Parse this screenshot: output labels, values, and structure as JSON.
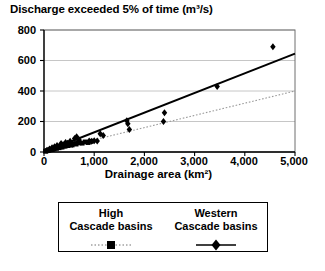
{
  "chart_data": {
    "type": "scatter",
    "title": "Discharge exceeded 5% of time (m³/s)",
    "xlabel": "Drainage area (km²)",
    "ylabel": "",
    "xlim": [
      0,
      5000
    ],
    "ylim": [
      0,
      800
    ],
    "xticks": [
      0,
      1000,
      2000,
      3000,
      4000,
      5000
    ],
    "xticklabels": [
      "0",
      "1,000",
      "2,000",
      "3,000",
      "4,000",
      "5,000"
    ],
    "yticks": [
      0,
      200,
      400,
      600,
      800
    ],
    "yticklabels": [
      "0",
      "200",
      "400",
      "600",
      "800"
    ],
    "grid": "horizontal",
    "legend_position": "below-axes",
    "series": [
      {
        "name": "High Cascade basins",
        "marker": "square",
        "line": "dotted",
        "color": "#000000",
        "trendline": {
          "x": [
            0,
            5000
          ],
          "y": [
            0,
            400
          ]
        },
        "points": [
          {
            "x": 30,
            "y": 5
          },
          {
            "x": 55,
            "y": 8
          },
          {
            "x": 75,
            "y": 10
          },
          {
            "x": 95,
            "y": 12
          },
          {
            "x": 120,
            "y": 14
          },
          {
            "x": 140,
            "y": 18
          },
          {
            "x": 165,
            "y": 16
          },
          {
            "x": 185,
            "y": 22
          },
          {
            "x": 200,
            "y": 20
          },
          {
            "x": 225,
            "y": 26
          },
          {
            "x": 250,
            "y": 24
          },
          {
            "x": 270,
            "y": 30
          },
          {
            "x": 300,
            "y": 28
          },
          {
            "x": 330,
            "y": 34
          },
          {
            "x": 360,
            "y": 32
          },
          {
            "x": 390,
            "y": 40
          },
          {
            "x": 420,
            "y": 38
          },
          {
            "x": 450,
            "y": 44
          },
          {
            "x": 480,
            "y": 42
          },
          {
            "x": 520,
            "y": 50
          },
          {
            "x": 560,
            "y": 46
          },
          {
            "x": 600,
            "y": 55
          },
          {
            "x": 640,
            "y": 52
          },
          {
            "x": 700,
            "y": 60
          },
          {
            "x": 760,
            "y": 58
          },
          {
            "x": 820,
            "y": 66
          },
          {
            "x": 880,
            "y": 62
          },
          {
            "x": 940,
            "y": 70
          }
        ]
      },
      {
        "name": "Western Cascade basins",
        "marker": "diamond",
        "line": "solid",
        "color": "#000000",
        "trendline": {
          "x": [
            0,
            5000
          ],
          "y": [
            0,
            645
          ]
        },
        "points": [
          {
            "x": 60,
            "y": 12
          },
          {
            "x": 110,
            "y": 20
          },
          {
            "x": 160,
            "y": 28
          },
          {
            "x": 210,
            "y": 34
          },
          {
            "x": 260,
            "y": 42
          },
          {
            "x": 310,
            "y": 38
          },
          {
            "x": 340,
            "y": 55
          },
          {
            "x": 380,
            "y": 48
          },
          {
            "x": 430,
            "y": 62
          },
          {
            "x": 470,
            "y": 58
          },
          {
            "x": 520,
            "y": 70
          },
          {
            "x": 560,
            "y": 50
          },
          {
            "x": 610,
            "y": 88
          },
          {
            "x": 650,
            "y": 100
          },
          {
            "x": 660,
            "y": 60
          },
          {
            "x": 700,
            "y": 78
          },
          {
            "x": 900,
            "y": 72
          },
          {
            "x": 950,
            "y": 70
          },
          {
            "x": 1000,
            "y": 74
          },
          {
            "x": 1060,
            "y": 72
          },
          {
            "x": 1120,
            "y": 120
          },
          {
            "x": 1180,
            "y": 108
          },
          {
            "x": 1650,
            "y": 205
          },
          {
            "x": 1670,
            "y": 185
          },
          {
            "x": 1700,
            "y": 148
          },
          {
            "x": 2380,
            "y": 200
          },
          {
            "x": 2400,
            "y": 258
          },
          {
            "x": 3450,
            "y": 430
          },
          {
            "x": 4560,
            "y": 690
          }
        ]
      }
    ]
  },
  "legend": {
    "entries": [
      {
        "line1": "High",
        "line2": "Cascade basins"
      },
      {
        "line1": "Western",
        "line2": "Cascade basins"
      }
    ]
  }
}
